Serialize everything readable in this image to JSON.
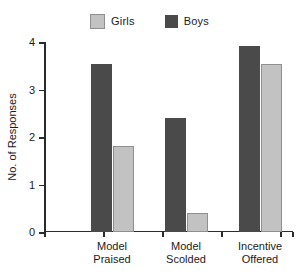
{
  "chart_data": {
    "type": "bar",
    "title": "",
    "xlabel": "",
    "ylabel": "No. of Responses",
    "ylim": [
      0,
      4
    ],
    "yticks": [
      0,
      1,
      2,
      3,
      4
    ],
    "ytick_labels": [
      "0",
      "1",
      "2",
      "3",
      "4"
    ],
    "grid": false,
    "legend_position": "top-center",
    "categories": [
      "Model\nPraised",
      "Model\nScolded",
      "Incentive\nOffered"
    ],
    "series": [
      {
        "name": "Girls",
        "color": "#c2c2c2",
        "values": [
          1.82,
          0.4,
          3.53
        ]
      },
      {
        "name": "Boys",
        "color": "#4a4a4a",
        "values": [
          3.53,
          2.41,
          3.91
        ]
      }
    ]
  },
  "legend": {
    "entries": [
      {
        "label": "Girls",
        "color": "#c2c2c2",
        "swatch_name": "legend-swatch-girls"
      },
      {
        "label": "Boys",
        "color": "#4a4a4a",
        "swatch_name": "legend-swatch-boys"
      }
    ]
  },
  "axes": {
    "y_title": "No. of Responses",
    "y_tick_labels": [
      "4",
      "3",
      "2",
      "1",
      "0"
    ],
    "x_category_labels": [
      "Model\nPraised",
      "Model\nScolded",
      "Incentive\nOffered"
    ]
  },
  "colors": {
    "girls": "#c2c2c2",
    "boys": "#4a4a4a",
    "axis": "#2b2b2b",
    "background": "#ffffff"
  }
}
